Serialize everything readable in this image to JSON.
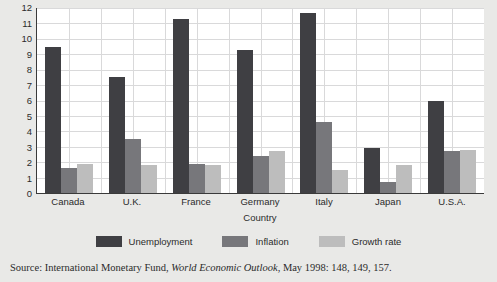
{
  "chart_data": {
    "type": "bar",
    "title": "",
    "xlabel": "Country",
    "ylabel": "Percentage",
    "ylim": [
      0,
      12
    ],
    "yticks": [
      0,
      1,
      2,
      3,
      4,
      5,
      6,
      7,
      8,
      9,
      10,
      11,
      12
    ],
    "grid": true,
    "legend_position": "bottom",
    "categories": [
      "Canada",
      "U.K.",
      "France",
      "Germany",
      "Italy",
      "Japan",
      "U.S.A."
    ],
    "series": [
      {
        "name": "Unemployment",
        "color": "#3f3f43",
        "values": [
          9.5,
          7.5,
          11.3,
          9.3,
          11.7,
          2.9,
          6.0
        ]
      },
      {
        "name": "Inflation",
        "color": "#77777b",
        "values": [
          1.6,
          3.5,
          1.9,
          2.4,
          4.6,
          0.7,
          2.7
        ]
      },
      {
        "name": "Growth rate",
        "color": "#bdbdbd",
        "values": [
          1.9,
          1.8,
          1.8,
          2.7,
          1.5,
          1.8,
          2.8
        ]
      }
    ]
  },
  "source": {
    "prefix": "Source: International Monetary Fund,",
    "italic": "World Economic Outlook",
    "suffix": ", May 1998: 148, 149, 157."
  }
}
